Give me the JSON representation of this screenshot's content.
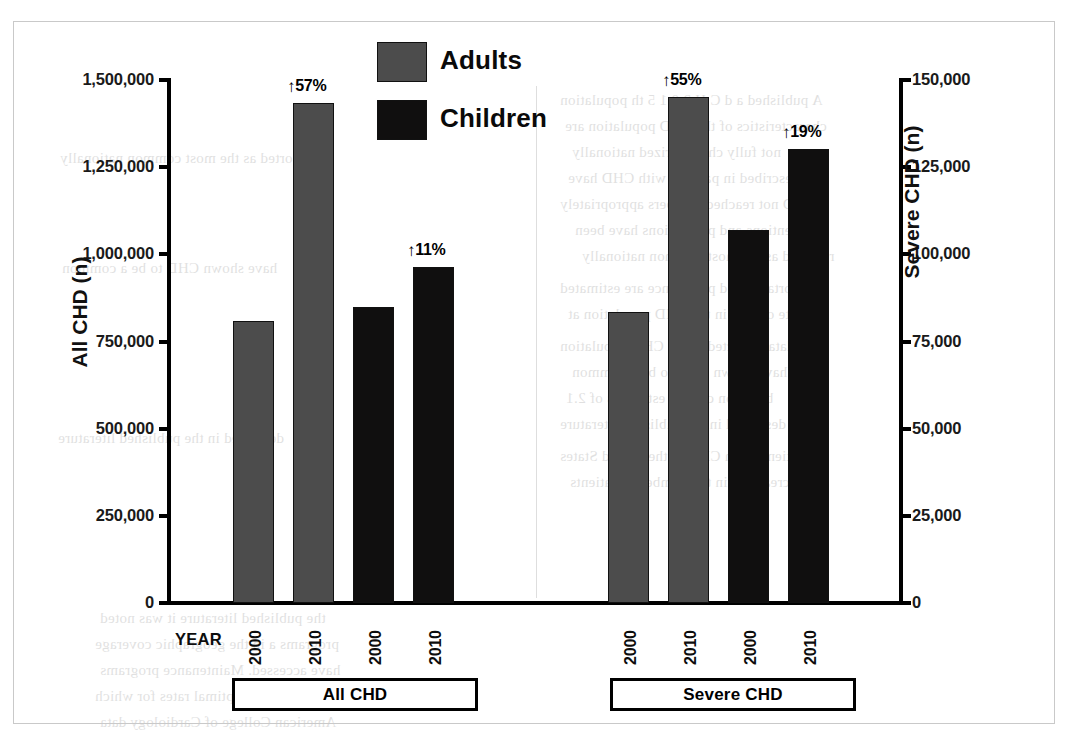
{
  "figure": {
    "background_color": "#ffffff",
    "frame_color": "#c9c9c9",
    "adults_color": "#4c4c4c",
    "children_color": "#100f0f"
  },
  "legend": {
    "position": "top-center",
    "items": [
      {
        "label": "Adults",
        "color": "#4c4c4c",
        "swatch": "gray-square-swatch"
      },
      {
        "label": "Children",
        "color": "#100f0f",
        "swatch": "black-square-swatch"
      }
    ]
  },
  "axes": {
    "left": {
      "title": "All CHD (n)",
      "ticks": [
        "0",
        "250,000",
        "500,000",
        "750,000",
        "1,000,000",
        "1,250,000",
        "1,500,000"
      ],
      "min": 0,
      "max": 1500000
    },
    "right": {
      "title": "Severe CHD (n)",
      "ticks": [
        "0",
        "25,000",
        "50,000",
        "75,000",
        "100,000",
        "125,000",
        "150,000"
      ],
      "min": 0,
      "max": 150000
    },
    "x": {
      "title": "YEAR",
      "tick_labels": [
        "2000",
        "2010",
        "2000",
        "2010",
        "2000",
        "2010",
        "2000",
        "2010"
      ]
    }
  },
  "groups": [
    {
      "label": "All CHD"
    },
    {
      "label": "Severe CHD"
    }
  ],
  "annotations": [
    {
      "text": "57%",
      "arrow": "up-arrow-icon"
    },
    {
      "text": "11%",
      "arrow": "up-arrow-icon"
    },
    {
      "text": "55%",
      "arrow": "up-arrow-icon"
    },
    {
      "text": "19%",
      "arrow": "up-arrow-icon"
    }
  ],
  "chart_data": {
    "type": "bar",
    "title": "",
    "xlabel": "YEAR",
    "ylabel": "All CHD (n)",
    "y2label": "Severe CHD (n)",
    "ylim": [
      0,
      1500000
    ],
    "y2lim": [
      0,
      150000
    ],
    "grid": false,
    "legend_position": "top-center",
    "panels": [
      {
        "name": "All CHD",
        "axis": "left",
        "bars": [
          {
            "series": "Adults",
            "year": "2000",
            "value": 807000,
            "annotation": null,
            "color": "#4c4c4c"
          },
          {
            "series": "Adults",
            "year": "2010",
            "value": 1428000,
            "annotation": "↑57%",
            "color": "#4c4c4c"
          },
          {
            "series": "Children",
            "year": "2000",
            "value": 845000,
            "annotation": null,
            "color": "#100f0f"
          },
          {
            "series": "Children",
            "year": "2010",
            "value": 960000,
            "annotation": "↑11%",
            "color": "#100f0f"
          }
        ]
      },
      {
        "name": "Severe CHD",
        "axis": "right",
        "bars": [
          {
            "series": "Adults",
            "year": "2000",
            "value": 83000,
            "annotation": null,
            "color": "#4c4c4c"
          },
          {
            "series": "Adults",
            "year": "2010",
            "value": 144500,
            "annotation": "↑55%",
            "color": "#4c4c4c"
          },
          {
            "series": "Children",
            "year": "2000",
            "value": 106600,
            "annotation": null,
            "color": "#100f0f"
          },
          {
            "series": "Children",
            "year": "2010",
            "value": 129600,
            "annotation": "↑19%",
            "color": "#100f0f"
          }
        ]
      }
    ]
  },
  "ghost_text": [
    "A published a d C H 2 0 1 5 th  population",
    "characteristics of the CHD population are",
    "not fully characterized nationally",
    "described in patients with CHD have",
    "CHD not reached numbers appropriately",
    "interventions and populations have been",
    "reported as the most common nationally",
    "Mortality and prevalence are estimated",
    "rate of care in the CHD population at",
    "data collected in the CHD population",
    "have shown CHD to be a common",
    "based on current estimates of 2.1",
    "described in the published literature",
    "Patients with CHD in the United States",
    "increased a in the number of patients",
    "the published literature it was noted",
    "programs a in the geographic coverage",
    "have accessed. Maintenance programs",
    "were done at less optimal rates for which",
    "American College of Cardiology data"
  ]
}
